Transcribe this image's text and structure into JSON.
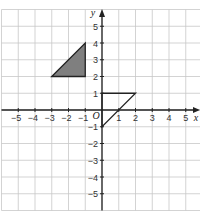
{
  "diagram": {
    "type": "coordinate-grid",
    "axes": {
      "x_label": "x",
      "y_label": "y",
      "origin_label": "O",
      "x_range": [
        -6,
        6
      ],
      "y_range": [
        -6,
        6
      ],
      "x_ticks": [
        "-5",
        "-4",
        "-3",
        "-2",
        "-1",
        "1",
        "2",
        "3",
        "4",
        "5"
      ],
      "y_ticks": [
        "5",
        "4",
        "3",
        "2",
        "1",
        "-1",
        "-2",
        "-3",
        "-4",
        "-5"
      ]
    },
    "shapes": [
      {
        "name": "shaded-triangle",
        "vertices": [
          [
            -3,
            2
          ],
          [
            -1,
            4
          ],
          [
            -1,
            2
          ]
        ],
        "fill": "#7f7f7f",
        "stroke": "#222222"
      },
      {
        "name": "outline-triangle",
        "vertices": [
          [
            0,
            1
          ],
          [
            2,
            1
          ],
          [
            0,
            -1
          ]
        ],
        "fill": "none",
        "stroke": "#222222"
      }
    ],
    "colors": {
      "grid": "#c8c8c8",
      "axis": "#222222",
      "background": "#ffffff"
    }
  }
}
